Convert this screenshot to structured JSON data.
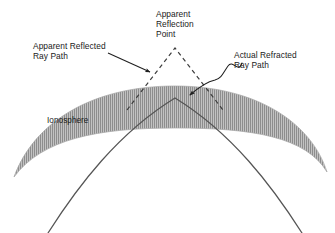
{
  "figure": {
    "type": "technical-diagram",
    "background_color": "#ffffff",
    "width": 335,
    "height": 233
  },
  "labels": {
    "apparent_reflection_point": "Apparent\nReflection\nPoint",
    "apparent_reflected_ray_path": "Apparent Reflected\nRay Path",
    "actual_refracted_ray_path": "Actual Refracted\nRay Path",
    "ionosphere": "Ionosphere"
  },
  "colors": {
    "text": "#1a1a1a",
    "ray_solid": "#4a4a4a",
    "ray_dashed": "#3d3d3d",
    "band_fill": "#b8b8b8",
    "band_hatch": "#8f8f8f",
    "band_edge": "#9a9a9a",
    "leader": "#2b2b2b"
  },
  "elements": {
    "ionosphere_band": {
      "name": "ionosphere-band",
      "description": "Gray vertically hatched arc spanning the figure",
      "apex_y": 86,
      "thickness": 42
    },
    "actual_refracted_ray": {
      "name": "actual-refracted-ray-path",
      "style": "solid",
      "apex": [
        175,
        98
      ],
      "description": "Continuous curve bending through the ionosphere and exiting bottom left and bottom right"
    },
    "apparent_reflected_ray": {
      "name": "apparent-reflected-ray-path",
      "style": "dashed",
      "apex": [
        175,
        48
      ],
      "description": "Dashed V-shaped path meeting at the apparent reflection point above the band"
    },
    "leaders": [
      {
        "name": "leader-apparent-reflected",
        "style": "straight-arrow",
        "from": [
          110,
          54
        ],
        "to": [
          152,
          73
        ]
      },
      {
        "name": "leader-actual-refracted",
        "style": "wavy-arrow",
        "from": [
          240,
          66
        ],
        "to": [
          185,
          97
        ]
      }
    ]
  }
}
